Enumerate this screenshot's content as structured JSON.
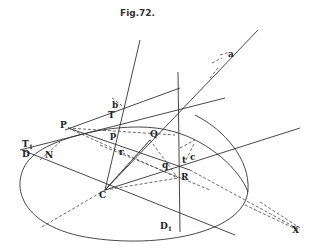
{
  "figure": {
    "title": "Fig.72.",
    "labels": {
      "a": "a",
      "b": "b",
      "T": "T",
      "T1": "T",
      "T1_sub": "1",
      "P": "P",
      "p": "p",
      "Q": "Q",
      "q": "q",
      "r": "r",
      "R": "R",
      "C": "C",
      "D": "D",
      "N": "N",
      "D1": "D",
      "D1_sub": "1",
      "c": "c",
      "t": "t",
      "X": "X"
    }
  }
}
